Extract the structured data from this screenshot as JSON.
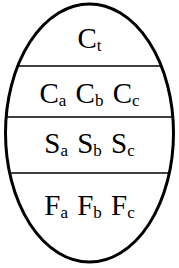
{
  "diagram": {
    "shape": "ellipse",
    "stroke_color": "#000000",
    "layers": [
      {
        "id": "top",
        "terms": [
          {
            "base": "C",
            "sub": "t"
          }
        ]
      },
      {
        "id": "layer-2",
        "terms": [
          {
            "base": "C",
            "sub": "a"
          },
          {
            "base": "C",
            "sub": "b"
          },
          {
            "base": "C",
            "sub": "c"
          }
        ]
      },
      {
        "id": "layer-3",
        "terms": [
          {
            "base": "S",
            "sub": "a"
          },
          {
            "base": "S",
            "sub": "b"
          },
          {
            "base": "S",
            "sub": "c"
          }
        ]
      },
      {
        "id": "layer-4",
        "terms": [
          {
            "base": "F",
            "sub": "a"
          },
          {
            "base": "F",
            "sub": "b"
          },
          {
            "base": "F",
            "sub": "c"
          }
        ]
      }
    ]
  }
}
